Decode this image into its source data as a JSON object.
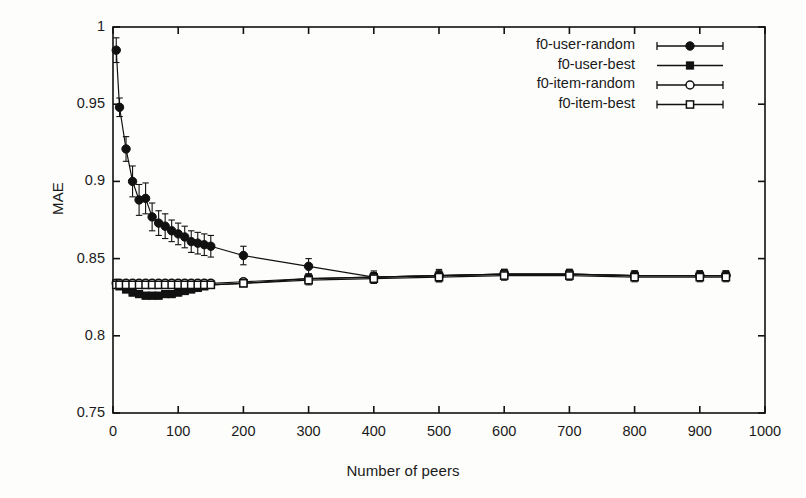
{
  "chart_data": {
    "type": "line",
    "title": "",
    "xlabel": "Number of peers",
    "ylabel": "MAE",
    "xlim": [
      0,
      1000
    ],
    "ylim": [
      0.75,
      1.0
    ],
    "xticks": [
      "0",
      "100",
      "200",
      "300",
      "400",
      "500",
      "600",
      "700",
      "800",
      "900",
      "1000"
    ],
    "xtick_values": [
      0,
      100,
      200,
      300,
      400,
      500,
      600,
      700,
      800,
      900,
      1000
    ],
    "yticks": [
      "1",
      "0.95",
      "0.9",
      "0.85",
      "0.8",
      "0.75"
    ],
    "ytick_values": [
      1.0,
      0.95,
      0.9,
      0.85,
      0.8,
      0.75
    ],
    "grid": false,
    "legend_position": "top-right",
    "errorbars": true,
    "series": [
      {
        "name": "f0-user-random",
        "marker": "filled-circle",
        "x": [
          5,
          10,
          20,
          30,
          40,
          50,
          60,
          70,
          80,
          90,
          100,
          110,
          120,
          130,
          140,
          150,
          200,
          300,
          400,
          500,
          600,
          700,
          800,
          900,
          940
        ],
        "values": [
          0.985,
          0.948,
          0.921,
          0.9,
          0.888,
          0.889,
          0.877,
          0.873,
          0.871,
          0.868,
          0.866,
          0.864,
          0.861,
          0.86,
          0.859,
          0.858,
          0.852,
          0.845,
          0.838,
          0.839,
          0.84,
          0.84,
          0.839,
          0.839,
          0.839
        ],
        "errors": [
          0.008,
          0.006,
          0.008,
          0.01,
          0.01,
          0.01,
          0.009,
          0.008,
          0.008,
          0.007,
          0.007,
          0.007,
          0.007,
          0.007,
          0.007,
          0.007,
          0.006,
          0.005,
          0.004,
          0.004,
          0.003,
          0.003,
          0.003,
          0.003,
          0.003
        ]
      },
      {
        "name": "f0-user-best",
        "marker": "filled-square",
        "x": [
          5,
          10,
          20,
          30,
          40,
          50,
          60,
          70,
          80,
          90,
          100,
          110,
          120,
          130,
          140,
          150,
          200,
          300,
          400,
          500,
          600,
          700,
          800,
          900,
          940
        ],
        "values": [
          0.834,
          0.832,
          0.83,
          0.828,
          0.827,
          0.826,
          0.826,
          0.826,
          0.827,
          0.827,
          0.828,
          0.829,
          0.83,
          0.831,
          0.832,
          0.833,
          0.834,
          0.837,
          0.838,
          0.839,
          0.84,
          0.84,
          0.839,
          0.839,
          0.839
        ],
        "errors": [
          0.002,
          0.002,
          0.002,
          0.002,
          0.002,
          0.002,
          0.002,
          0.002,
          0.002,
          0.002,
          0.002,
          0.002,
          0.002,
          0.002,
          0.002,
          0.002,
          0.002,
          0.003,
          0.003,
          0.003,
          0.003,
          0.003,
          0.003,
          0.003,
          0.003
        ]
      },
      {
        "name": "f0-item-random",
        "marker": "open-circle",
        "x": [
          5,
          10,
          20,
          30,
          40,
          50,
          60,
          70,
          80,
          90,
          100,
          110,
          120,
          130,
          140,
          150,
          200,
          300,
          400,
          500,
          600,
          700,
          800,
          900,
          940
        ],
        "values": [
          0.834,
          0.834,
          0.834,
          0.834,
          0.834,
          0.834,
          0.834,
          0.834,
          0.834,
          0.834,
          0.834,
          0.834,
          0.834,
          0.834,
          0.834,
          0.834,
          0.835,
          0.837,
          0.838,
          0.839,
          0.84,
          0.84,
          0.839,
          0.839,
          0.839
        ],
        "errors": [
          0.002,
          0.002,
          0.002,
          0.002,
          0.002,
          0.002,
          0.002,
          0.002,
          0.002,
          0.002,
          0.002,
          0.002,
          0.002,
          0.002,
          0.002,
          0.002,
          0.002,
          0.003,
          0.003,
          0.003,
          0.003,
          0.003,
          0.003,
          0.003,
          0.003
        ]
      },
      {
        "name": "f0-item-best",
        "marker": "open-square",
        "x": [
          5,
          10,
          20,
          30,
          40,
          50,
          60,
          70,
          80,
          90,
          100,
          110,
          120,
          130,
          140,
          150,
          200,
          300,
          400,
          500,
          600,
          700,
          800,
          900,
          940
        ],
        "values": [
          0.833,
          0.833,
          0.833,
          0.833,
          0.833,
          0.833,
          0.833,
          0.833,
          0.833,
          0.833,
          0.833,
          0.833,
          0.833,
          0.833,
          0.833,
          0.833,
          0.834,
          0.836,
          0.837,
          0.838,
          0.839,
          0.839,
          0.838,
          0.838,
          0.838
        ],
        "errors": [
          0.002,
          0.002,
          0.002,
          0.002,
          0.002,
          0.002,
          0.002,
          0.002,
          0.002,
          0.002,
          0.002,
          0.002,
          0.002,
          0.002,
          0.002,
          0.002,
          0.002,
          0.003,
          0.003,
          0.003,
          0.003,
          0.003,
          0.003,
          0.003,
          0.003
        ]
      }
    ],
    "colors": {
      "line": "#111111",
      "marker": "#111111",
      "axis": "#111111",
      "background": "#fdfdfc"
    }
  }
}
